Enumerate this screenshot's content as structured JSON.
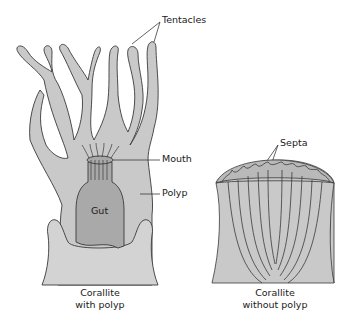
{
  "diagram": {
    "colors": {
      "body_fill": "#c9c9c9",
      "gut_fill": "#a9a9a9",
      "corallite_fill": "#d3d3d3",
      "outline": "#3a3a3a"
    },
    "labels": {
      "tentacles": "Tentacles",
      "mouth": "Mouth",
      "polyp": "Polyp",
      "gut": "Gut",
      "septa": "Septa"
    },
    "captions": {
      "left_line1": "Corallite",
      "left_line2": "with polyp",
      "right_line1": "Corallite",
      "right_line2": "without polyp"
    }
  }
}
